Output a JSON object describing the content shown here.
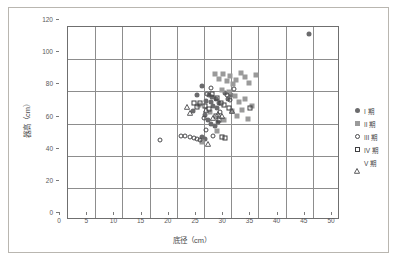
{
  "chart_data": {
    "type": "scatter",
    "title": "",
    "xlabel": "底径（cm）",
    "ylabel": "器高（cm）",
    "xlim": [
      0,
      50
    ],
    "ylim": [
      0,
      120
    ],
    "xticks": [
      0,
      5,
      10,
      15,
      20,
      25,
      30,
      35,
      40,
      45,
      50
    ],
    "yticks": [
      0,
      20,
      40,
      60,
      80,
      100,
      120
    ],
    "grid": true,
    "legend_position": "right",
    "series": [
      {
        "name": "I 期",
        "marker": "filled-circle",
        "color": "#6b6b6d",
        "points": [
          [
            25.4,
            72.5
          ],
          [
            26.3,
            78.5
          ],
          [
            27.1,
            69.0
          ],
          [
            27.6,
            73.0
          ],
          [
            27.9,
            68.5
          ],
          [
            28.2,
            71.5
          ],
          [
            28.4,
            66.0
          ],
          [
            28.8,
            70.0
          ],
          [
            29.1,
            64.5
          ],
          [
            29.4,
            67.5
          ],
          [
            26.8,
            60.5
          ],
          [
            27.4,
            57.5
          ],
          [
            28.0,
            55.0
          ],
          [
            28.6,
            53.5
          ],
          [
            29.2,
            56.0
          ],
          [
            26.2,
            46.5
          ],
          [
            26.9,
            45.5
          ],
          [
            30.6,
            74.0
          ],
          [
            31.0,
            70.5
          ],
          [
            31.6,
            72.5
          ],
          [
            24.6,
            63.0
          ],
          [
            45.9,
            110.5
          ]
        ]
      },
      {
        "name": "II 期",
        "marker": "filled-square",
        "color": "#9a9a9a",
        "points": [
          [
            28.6,
            85.5
          ],
          [
            29.4,
            83.0
          ],
          [
            30.2,
            86.0
          ],
          [
            30.8,
            81.5
          ],
          [
            31.4,
            84.5
          ],
          [
            32.0,
            79.5
          ],
          [
            32.6,
            82.0
          ],
          [
            33.4,
            86.5
          ],
          [
            34.1,
            84.0
          ],
          [
            35.0,
            80.5
          ],
          [
            36.2,
            85.0
          ],
          [
            30.0,
            76.0
          ],
          [
            31.2,
            74.5
          ],
          [
            32.4,
            72.0
          ],
          [
            33.0,
            68.5
          ],
          [
            34.2,
            70.5
          ],
          [
            35.4,
            66.0
          ],
          [
            31.8,
            62.5
          ],
          [
            32.8,
            60.0
          ],
          [
            30.4,
            57.5
          ],
          [
            29.0,
            50.5
          ],
          [
            26.2,
            43.5
          ],
          [
            27.8,
            62.0
          ],
          [
            25.8,
            66.5
          ],
          [
            33.6,
            63.5
          ],
          [
            34.8,
            58.0
          ]
        ]
      },
      {
        "name": "III 期",
        "marker": "open-circle",
        "color": "#4a4a4c",
        "points": [
          [
            18.6,
            44.5
          ],
          [
            22.4,
            47.0
          ],
          [
            23.2,
            47.5
          ],
          [
            24.0,
            46.5
          ],
          [
            24.8,
            46.0
          ],
          [
            25.4,
            45.5
          ],
          [
            26.0,
            45.0
          ],
          [
            27.2,
            73.5
          ],
          [
            28.0,
            77.0
          ],
          [
            30.8,
            72.5
          ],
          [
            31.4,
            69.5
          ],
          [
            32.2,
            76.5
          ],
          [
            29.6,
            62.0
          ],
          [
            26.6,
            58.5
          ],
          [
            27.0,
            51.0
          ],
          [
            28.4,
            47.0
          ]
        ]
      },
      {
        "name": "IV 期",
        "marker": "open-square",
        "color": "#3f3f41",
        "points": [
          [
            28.2,
            73.5
          ],
          [
            29.0,
            71.0
          ],
          [
            29.8,
            68.0
          ],
          [
            30.4,
            66.5
          ],
          [
            31.2,
            64.5
          ],
          [
            27.6,
            64.0
          ],
          [
            26.8,
            66.0
          ],
          [
            26.0,
            67.5
          ],
          [
            25.4,
            65.0
          ],
          [
            35.2,
            64.5
          ],
          [
            30.0,
            46.5
          ],
          [
            30.6,
            46.0
          ],
          [
            28.8,
            60.0
          ],
          [
            29.4,
            57.0
          ],
          [
            24.8,
            68.0
          ]
        ]
      },
      {
        "name": "V 期",
        "marker": "open-triangle",
        "color": "#4a4a4c",
        "points": [
          [
            23.6,
            70.5
          ],
          [
            24.0,
            66.5
          ],
          [
            29.2,
            66.0
          ],
          [
            30.0,
            64.5
          ],
          [
            28.4,
            63.5
          ],
          [
            27.0,
            68.5
          ],
          [
            27.4,
            47.0
          ],
          [
            31.8,
            67.5
          ]
        ]
      }
    ]
  },
  "legend": {
    "items": [
      {
        "label": "I 期",
        "marker": "filled-circle"
      },
      {
        "label": "II 期",
        "marker": "filled-square"
      },
      {
        "label": "III 期",
        "marker": "open-circle"
      },
      {
        "label": "IV 期",
        "marker": "open-square"
      },
      {
        "label": "V 期",
        "marker": "open-triangle"
      }
    ]
  }
}
